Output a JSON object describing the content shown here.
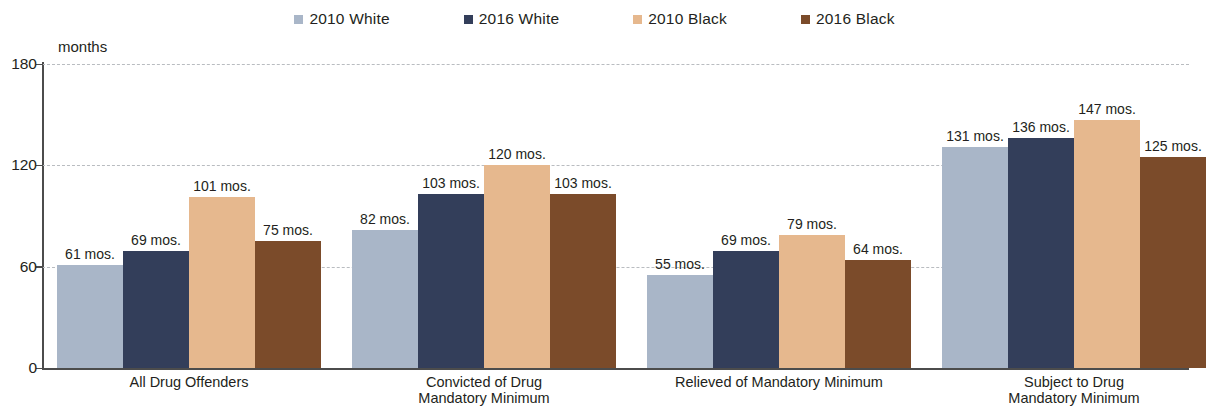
{
  "chart_data": {
    "type": "bar",
    "title": "",
    "subtitle": "",
    "xlabel": "",
    "ylabel": "months",
    "ylim": [
      0,
      180
    ],
    "yticks": [
      0,
      60,
      120,
      180
    ],
    "grid": true,
    "legend_position": "top-center",
    "value_suffix": "mos.",
    "categories": [
      "All Drug Offenders",
      "Convicted of Drug Mandatory Minimum",
      "Relieved of Mandatory Minimum",
      "Subject to Drug Mandatory Minimum"
    ],
    "category_lines": [
      [
        "All Drug Offenders"
      ],
      [
        "Convicted of Drug",
        "Mandatory Minimum"
      ],
      [
        "Relieved of Mandatory Minimum"
      ],
      [
        "Subject to Drug",
        "Mandatory Minimum"
      ]
    ],
    "series": [
      {
        "name": "2010 White",
        "color": "#a9b6c8",
        "values": [
          61,
          82,
          55,
          131
        ]
      },
      {
        "name": "2016 White",
        "color": "#333e5a",
        "values": [
          69,
          103,
          69,
          136
        ]
      },
      {
        "name": "2010 Black",
        "color": "#e6b88e",
        "values": [
          101,
          120,
          79,
          147
        ]
      },
      {
        "name": "2016 Black",
        "color": "#7b4b2a",
        "values": [
          75,
          103,
          64,
          125
        ]
      }
    ],
    "data_labels": [
      [
        "61 mos.",
        "69 mos.",
        "101 mos.",
        "75 mos."
      ],
      [
        "82 mos.",
        "103 mos.",
        "120 mos.",
        "103 mos."
      ],
      [
        "55 mos.",
        "69 mos.",
        "79 mos.",
        "64 mos."
      ],
      [
        "131 mos.",
        "136 mos.",
        "147 mos.",
        "125 mos."
      ]
    ],
    "ytick_labels": [
      "0",
      "60",
      "120",
      "180"
    ]
  },
  "legend": {
    "items": [
      {
        "label": "2010 White",
        "color": "#a9b6c8"
      },
      {
        "label": "2016 White",
        "color": "#333e5a"
      },
      {
        "label": "2010 Black",
        "color": "#e6b88e"
      },
      {
        "label": "2016 Black",
        "color": "#7b4b2a"
      }
    ]
  },
  "axis": {
    "units": "months",
    "line_color": "#4c4c4c",
    "grid_color": "#b9bcc0"
  }
}
